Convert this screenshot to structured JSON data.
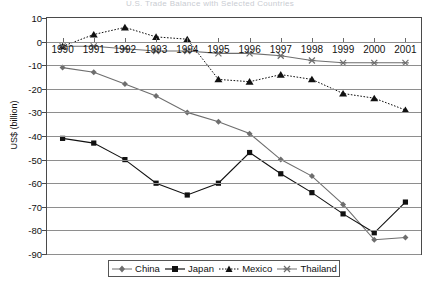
{
  "chart_data": {
    "type": "line",
    "title": "U.S. Trade Balance with Selected Countries",
    "xlabel": "",
    "ylabel": "US$ (billion)",
    "x": [
      1990,
      1991,
      1992,
      1993,
      1994,
      1995,
      1996,
      1997,
      1998,
      1999,
      2000,
      2001
    ],
    "categories": [
      "1990",
      "1991",
      "1992",
      "1993",
      "1994",
      "1995",
      "1996",
      "1997",
      "1998",
      "1999",
      "2000",
      "2001"
    ],
    "ylim": [
      -90,
      10
    ],
    "ytick_labels": [
      "10",
      "0",
      "-10",
      "-20",
      "-30",
      "-40",
      "-50",
      "-60",
      "-70",
      "-80",
      "-90"
    ],
    "ytick_values": [
      10,
      0,
      -10,
      -20,
      -30,
      -40,
      -50,
      -60,
      -70,
      -80,
      -90
    ],
    "grid": true,
    "legend_position": "bottom",
    "series": [
      {
        "name": "China",
        "color": "#6e6e6e",
        "marker": "diamond",
        "dash": "solid",
        "values": [
          -11,
          -13,
          -18,
          -23,
          -30,
          -34,
          -39,
          -50,
          -57,
          -69,
          -84,
          -83
        ]
      },
      {
        "name": "Japan",
        "color": "#111111",
        "marker": "square",
        "dash": "solid",
        "values": [
          -41,
          -43,
          -50,
          -60,
          -65,
          -60,
          -47,
          -56,
          -64,
          -73,
          -81,
          -68
        ]
      },
      {
        "name": "Mexico",
        "color": "#111111",
        "marker": "triangle",
        "dash": "dotted",
        "values": [
          -2,
          3,
          6,
          2,
          1,
          -16,
          -17,
          -14,
          -16,
          -22,
          -24,
          -29
        ]
      },
      {
        "name": "Thailand",
        "color": "#6e6e6e",
        "marker": "star",
        "dash": "solid",
        "values": [
          -2,
          -2,
          -3,
          -4,
          -4,
          -5,
          -5,
          -6,
          -8,
          -9,
          -9,
          -9
        ]
      }
    ]
  },
  "legend": {
    "items": [
      {
        "label": "China"
      },
      {
        "label": "Japan"
      },
      {
        "label": "Mexico"
      },
      {
        "label": "Thailand"
      }
    ]
  }
}
